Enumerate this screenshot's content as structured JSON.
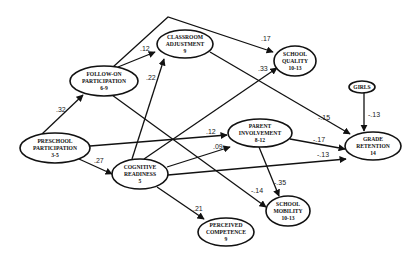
{
  "diagram": {
    "nodes": [
      {
        "id": "follow_on",
        "line1": "FOLLOW-ON",
        "line2": "PARTICIPATION",
        "line3": "6-9",
        "cx": 104,
        "cy": 81,
        "rx": 34,
        "ry": 15
      },
      {
        "id": "classroom",
        "line1": "CLASSROOM",
        "line2": "ADJUSTMENT",
        "line3": "9",
        "cx": 185,
        "cy": 44,
        "rx": 28,
        "ry": 14
      },
      {
        "id": "school_quality",
        "line1": "SCHOOL",
        "line2": "QUALITY",
        "line3": "10-13",
        "cx": 295,
        "cy": 61,
        "rx": 21,
        "ry": 15
      },
      {
        "id": "girls",
        "line1": "GIRLS",
        "line2": "",
        "line3": "",
        "cx": 362,
        "cy": 87,
        "rx": 13,
        "ry": 6
      },
      {
        "id": "preschool",
        "line1": "PRESCHOOL",
        "line2": "PARTICIPATION",
        "line3": "3-5",
        "cx": 55,
        "cy": 148,
        "rx": 35,
        "ry": 15
      },
      {
        "id": "cognitive",
        "line1": "COGNITIVE",
        "line2": "READINESS",
        "line3": "5",
        "cx": 140,
        "cy": 174,
        "rx": 28,
        "ry": 15
      },
      {
        "id": "parent",
        "line1": "PARENT",
        "line2": "INVOLVEMENT",
        "line3": "8-12",
        "cx": 260,
        "cy": 133,
        "rx": 32,
        "ry": 14
      },
      {
        "id": "grade_retention",
        "line1": "GRADE",
        "line2": "RETENTION",
        "line3": "14",
        "cx": 373,
        "cy": 146,
        "rx": 28,
        "ry": 14
      },
      {
        "id": "school_mobility",
        "line1": "SCHOOL",
        "line2": "MOBILITY",
        "line3": "10-13",
        "cx": 288,
        "cy": 211,
        "rx": 22,
        "ry": 15
      },
      {
        "id": "perceived",
        "line1": "PERCEIVED",
        "line2": "COMPETENCE",
        "line3": "9",
        "cx": 226,
        "cy": 232,
        "rx": 28,
        "ry": 14
      }
    ],
    "edges": [
      {
        "from": "preschool",
        "to": "follow_on",
        "coef": ".32",
        "path": "M42,134 L83,95",
        "lx": 56,
        "ly": 112
      },
      {
        "from": "preschool",
        "to": "cognitive",
        "coef": ".27",
        "path": "M79,159 L112,174",
        "lx": 94,
        "ly": 163
      },
      {
        "from": "follow_on",
        "to": "classroom",
        "coef": ".12",
        "path": "M118,67 L155,52",
        "lx": 140,
        "ly": 51
      },
      {
        "from": "follow_on",
        "to": "school_quality",
        "coef": ".17",
        "path": "M113,67 L168,17 L273,52",
        "lx": 261,
        "ly": 41
      },
      {
        "from": "follow_on",
        "to": "school_mobility",
        "coef": "-.14",
        "path": "M112,95 L266,207",
        "lx": 251,
        "ly": 193
      },
      {
        "from": "cognitive",
        "to": "classroom",
        "coef": ".22",
        "path": "M132,159 L164,59",
        "lx": 146,
        "ly": 80
      },
      {
        "from": "cognitive",
        "to": "school_quality",
        "coef": ".33",
        "path": "M144,159 L277,68",
        "lx": 258,
        "ly": 71
      },
      {
        "from": "classroom",
        "to": "grade_retention",
        "coef": "-.15",
        "path": "M210,52 L350,134",
        "lx": 318,
        "ly": 120
      },
      {
        "from": "preschool",
        "to": "parent",
        "coef": ".12",
        "path": "M90,146 L227,135",
        "lx": 206,
        "ly": 134
      },
      {
        "from": "cognitive",
        "to": "parent",
        "coef": ".09",
        "path": "M167,167 L230,147",
        "lx": 213,
        "ly": 149
      },
      {
        "from": "cognitive",
        "to": "grade_retention",
        "coef": "-.13",
        "path": "M168,175 L346,159",
        "lx": 317,
        "ly": 157
      },
      {
        "from": "parent",
        "to": "grade_retention",
        "coef": "-.17",
        "path": "M290,139 L345,149",
        "lx": 313,
        "ly": 142
      },
      {
        "from": "parent",
        "to": "school_mobility",
        "coef": "-.35",
        "path": "M259,147 L279,196",
        "lx": 274,
        "ly": 185
      },
      {
        "from": "cognitive",
        "to": "perceived",
        "coef": ".21",
        "path": "M157,187 L204,219",
        "lx": 193,
        "ly": 211
      },
      {
        "from": "girls",
        "to": "grade_retention",
        "coef": "-.13",
        "path": "M364,93 L364,131",
        "lx": 368,
        "ly": 117
      }
    ]
  }
}
